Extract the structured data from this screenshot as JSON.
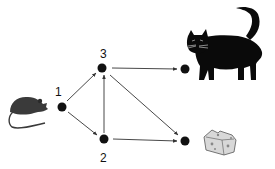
{
  "diagram": {
    "type": "directed-graph",
    "nodes": [
      {
        "id": "1",
        "label": "1",
        "x": 62,
        "y": 107
      },
      {
        "id": "3",
        "label": "3",
        "x": 102,
        "y": 68
      },
      {
        "id": "2",
        "label": "2",
        "x": 104,
        "y": 139
      },
      {
        "id": "cat",
        "label": "",
        "x": 185,
        "y": 69
      },
      {
        "id": "cheese",
        "label": "",
        "x": 185,
        "y": 141
      }
    ],
    "edges": [
      {
        "from": "1",
        "to": "3"
      },
      {
        "from": "1",
        "to": "2"
      },
      {
        "from": "2",
        "to": "3"
      },
      {
        "from": "3",
        "to": "cat"
      },
      {
        "from": "3",
        "to": "cheese"
      },
      {
        "from": "2",
        "to": "cheese"
      }
    ],
    "illustrations": {
      "start": "mouse-icon",
      "top_end": "cat-icon",
      "bottom_end": "cheese-icon"
    },
    "colors": {
      "node": "#111111",
      "edge": "#333333",
      "mouse": "#3a3a3a",
      "cat": "#0a0a0a",
      "cheese": "#d8d8d8"
    }
  }
}
